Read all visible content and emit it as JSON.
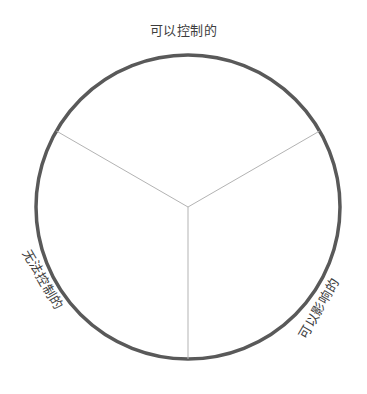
{
  "diagram": {
    "type": "circle-of-control",
    "background_color": "#ffffff",
    "circle": {
      "center_x": 188,
      "center_y": 207,
      "radius": 152,
      "stroke_color": "#595959",
      "stroke_width": 3.5
    },
    "divider": {
      "stroke_color": "#b3b3b3",
      "stroke_width": 1,
      "count": 3,
      "angles_deg": [
        90,
        210,
        330
      ]
    },
    "sectors": [
      {
        "id": "controllable",
        "label": "可以控制的",
        "position": "top",
        "rotation_deg": 0
      },
      {
        "id": "uncontrollable",
        "label": "无法控制的",
        "position": "lower-left",
        "rotation_deg": 60
      },
      {
        "id": "influenceable",
        "label": "可以影响的",
        "position": "lower-right",
        "rotation_deg": -60
      }
    ],
    "text_color": "#3d3d3d"
  }
}
